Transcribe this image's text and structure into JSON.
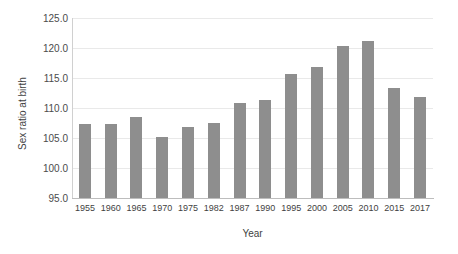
{
  "chart_data": {
    "type": "bar",
    "title": "",
    "xlabel": "Year",
    "ylabel": "Sex ratio at birth",
    "categories": [
      "1955",
      "1960",
      "1965",
      "1970",
      "1975",
      "1982",
      "1987",
      "1990",
      "1995",
      "2000",
      "2005",
      "2010",
      "2015",
      "2017"
    ],
    "values": [
      107.3,
      107.3,
      108.5,
      105.2,
      106.8,
      107.5,
      110.9,
      111.4,
      115.6,
      116.9,
      120.3,
      121.1,
      113.4,
      111.9
    ],
    "ylim": [
      95.0,
      125.0
    ],
    "ytick_labels": [
      "125.0",
      "120.0",
      "115.0",
      "110.0",
      "105.0",
      "100.0",
      "95.0"
    ],
    "ytick_values": [
      125.0,
      120.0,
      115.0,
      110.0,
      105.0,
      100.0,
      95.0
    ],
    "grid": true,
    "legend": "none",
    "bar_color": "#8e8e8e",
    "grid_color": "#e9e9e9",
    "axis_color": "#bdbdbd"
  }
}
